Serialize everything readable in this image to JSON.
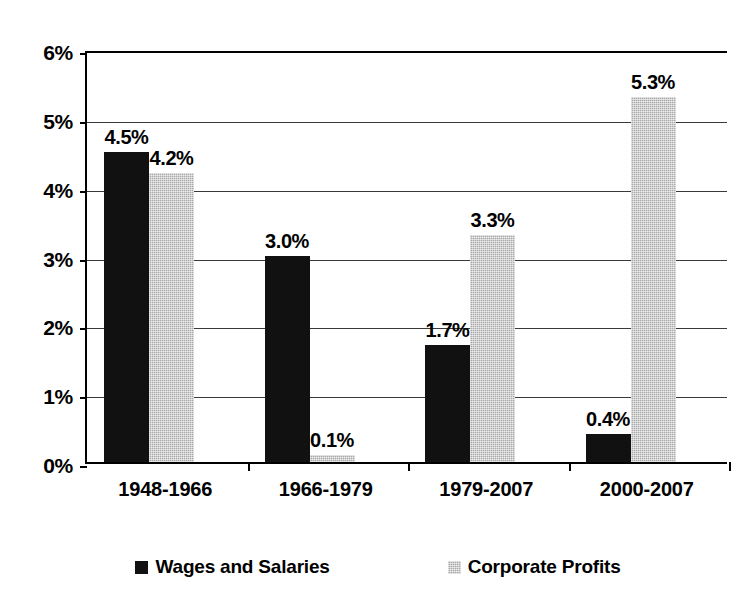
{
  "chart_data": {
    "type": "bar",
    "title": "",
    "subtitle": "",
    "xlabel": "",
    "ylabel": "",
    "categories": [
      "1948-1966",
      "1966-1979",
      "1979-2007",
      "2000-2007"
    ],
    "series": [
      {
        "name": "Wages and Salaries",
        "color": "#111111",
        "values": [
          4.5,
          3.0,
          1.7,
          0.4
        ],
        "labels": [
          "4.5%",
          "3.0%",
          "1.7%",
          "0.4%"
        ]
      },
      {
        "name": "Corporate Profits",
        "color": "#a9a9a9",
        "values": [
          4.2,
          0.1,
          3.3,
          5.3
        ],
        "labels": [
          "4.2%",
          "0.1%",
          "3.3%",
          "5.3%"
        ]
      }
    ],
    "ylim": [
      0,
      6
    ],
    "ytick_values": [
      0,
      1,
      2,
      3,
      4,
      5,
      6
    ],
    "ytick_labels": [
      "0%",
      "1%",
      "2%",
      "3%",
      "4%",
      "5%",
      "6%"
    ],
    "grid": true,
    "grid_axis": "y",
    "legend_position": "bottom",
    "value_labels_shown": true,
    "units": "percent"
  },
  "legend": {
    "items": [
      {
        "label": "Wages and Salaries",
        "swatch": "wages-swatch-icon"
      },
      {
        "label": "Corporate Profits",
        "swatch": "profits-swatch-icon"
      }
    ]
  }
}
